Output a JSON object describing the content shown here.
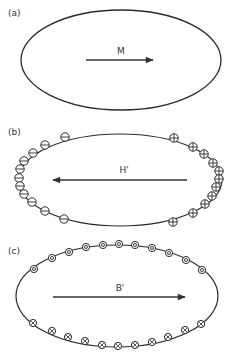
{
  "figure": {
    "colors": {
      "line": "#2a2a2a",
      "background": "#ffffff",
      "arrow": "#333333"
    },
    "panels": [
      {
        "id": "a",
        "label": "(a)",
        "label_pos": [
          8,
          16
        ],
        "ellipse": {
          "cx": 121,
          "cy": 60,
          "rx": 100,
          "ry": 50
        },
        "vector": {
          "name": "M",
          "x1": 86,
          "x2": 153,
          "y": 60,
          "direction": "right",
          "label_pos": [
            121,
            54
          ]
        },
        "surface_symbols": []
      },
      {
        "id": "b",
        "label": "(b)",
        "label_pos": [
          8,
          135
        ],
        "ellipse": {
          "cx": 120,
          "cy": 180,
          "rx": 102,
          "ry": 46
        },
        "vector": {
          "name": "H'",
          "x1": 187,
          "x2": 53,
          "y": 180,
          "direction": "left",
          "label_pos": [
            124,
            173
          ]
        },
        "surface_symbols": [
          {
            "type": "minus",
            "side": "left",
            "count": 11,
            "positions": [
              [
                65,
                137
              ],
              [
                45,
                145
              ],
              [
                33,
                153
              ],
              [
                24,
                161
              ],
              [
                20,
                169
              ],
              [
                19,
                178
              ],
              [
                20,
                186
              ],
              [
                24,
                194
              ],
              [
                32,
                202
              ],
              [
                45,
                211
              ],
              [
                64,
                219
              ]
            ]
          },
          {
            "type": "plus",
            "side": "right",
            "count": 11,
            "positions": [
              [
                174,
                138
              ],
              [
                193,
                147
              ],
              [
                204,
                154
              ],
              [
                213,
                163
              ],
              [
                219,
                171
              ],
              [
                219,
                179
              ],
              [
                216,
                187
              ],
              [
                212,
                196
              ],
              [
                205,
                204
              ],
              [
                193,
                213
              ],
              [
                173,
                222
              ]
            ]
          }
        ]
      },
      {
        "id": "c",
        "label": "(c)",
        "label_pos": [
          8,
          254
        ],
        "ellipse": {
          "cx": 117,
          "cy": 296,
          "rx": 101,
          "ry": 51
        },
        "vector": {
          "name": "B'",
          "x1": 53,
          "x2": 185,
          "y": 297,
          "direction": "right",
          "label_pos": [
            120,
            291
          ]
        },
        "surface_symbols": [
          {
            "type": "dot-out-of-page",
            "side": "top",
            "count": 11,
            "positions": [
              [
                34,
                269
              ],
              [
                52,
                258
              ],
              [
                69,
                252
              ],
              [
                86,
                247
              ],
              [
                103,
                245
              ],
              [
                119,
                244
              ],
              [
                135,
                245
              ],
              [
                152,
                248
              ],
              [
                169,
                253
              ],
              [
                186,
                260
              ],
              [
                202,
                270
              ]
            ]
          },
          {
            "type": "cross-into-page",
            "side": "bottom",
            "count": 11,
            "positions": [
              [
                33,
                323
              ],
              [
                52,
                331
              ],
              [
                68,
                337
              ],
              [
                85,
                341
              ],
              [
                102,
                345
              ],
              [
                118,
                346
              ],
              [
                135,
                345
              ],
              [
                152,
                342
              ],
              [
                168,
                337
              ],
              [
                185,
                330
              ],
              [
                201,
                324
              ]
            ]
          }
        ]
      }
    ]
  }
}
